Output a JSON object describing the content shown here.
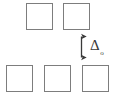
{
  "figure": {
    "name": "lattice-gap-diagram",
    "background_color": "#ffffff",
    "stroke_color": "#7d7d7d",
    "arrow_color": "#3a3a3a",
    "width": 115,
    "height": 97
  },
  "squares": {
    "top_row": [
      {
        "name": "top-square-1",
        "x": 26,
        "y": 3,
        "size": 27
      },
      {
        "name": "top-square-2",
        "x": 63,
        "y": 3,
        "size": 27
      }
    ],
    "bottom_row": [
      {
        "name": "bottom-square-1",
        "x": 6,
        "y": 65,
        "size": 27
      },
      {
        "name": "bottom-square-2",
        "x": 44,
        "y": 65,
        "size": 27
      },
      {
        "name": "bottom-square-3",
        "x": 82,
        "y": 65,
        "size": 27
      }
    ]
  },
  "gap_annotation": {
    "arrow_name": "gap-double-arrow",
    "arrow_x": 81,
    "arrow_top_y": 31,
    "arrow_bottom_y": 63,
    "label_symbol": "Δ",
    "label_subscript": "o",
    "label_full": "Δo",
    "label_x": 90,
    "label_y": 37
  }
}
